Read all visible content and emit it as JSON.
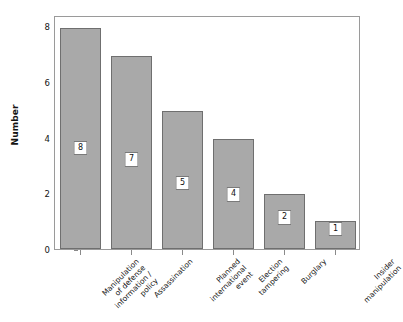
{
  "chart_data": {
    "type": "bar",
    "title": "",
    "xlabel": "",
    "ylabel": "Number",
    "ylim": [
      0,
      8.4
    ],
    "grid": false,
    "legend": null,
    "categories": [
      "Manipulation of defense information / policy",
      "Assassination",
      "Planned international event",
      "Election tampering",
      "Burglary",
      "Insider manipulation"
    ],
    "category_lines": [
      [
        "Manipulation",
        "of defense",
        "information /",
        "policy"
      ],
      [
        "Assassination"
      ],
      [
        "Planned",
        "international",
        "event"
      ],
      [
        "Election",
        "tampering"
      ],
      [
        "Burglary"
      ],
      [
        "Insider",
        "manipulation"
      ]
    ],
    "values": [
      8,
      7,
      5,
      4,
      2,
      1
    ],
    "value_labels": [
      "8",
      "7",
      "5",
      "4",
      "2",
      "1"
    ],
    "yticks": [
      0,
      2,
      4,
      6,
      8
    ],
    "ytick_labels": [
      "0",
      "2",
      "4",
      "6",
      "8"
    ],
    "bar_color": "#a9a9a9",
    "bar_edge_color": "#6f6f6f",
    "axis_color": "#9a9a9a",
    "text_color": "#141414",
    "label_box_color": "#ffffff"
  }
}
